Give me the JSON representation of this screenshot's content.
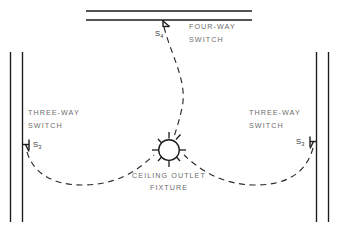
{
  "diagram": {
    "canvas": {
      "width": 339,
      "height": 234,
      "background": "#ffffff"
    },
    "colors": {
      "line": "#1a1a1a",
      "wire": "#2b2b2b",
      "label": "#6c6c6c",
      "symbol_label": "#3a3a3a",
      "background": "#ffffff"
    },
    "labels": {
      "four_way_line1": "FOUR-WAY",
      "four_way_line2": "SWITCH",
      "three_way_left_line1": "THREE-WAY",
      "three_way_left_line2": "SWITCH",
      "three_way_right_line1": "THREE-WAY",
      "three_way_right_line2": "SWITCH",
      "fixture_line1": "CEILING OUTLET",
      "fixture_line2": "FIXTURE"
    },
    "symbols": {
      "four_way_switch": {
        "letter": "S",
        "subscript": "4",
        "name": "four-way-switch-symbol"
      },
      "three_way_switch_left": {
        "letter": "S",
        "subscript": "3",
        "name": "three-way-switch-symbol-left"
      },
      "three_way_switch_right": {
        "letter": "S",
        "subscript": "3",
        "name": "three-way-switch-symbol-right"
      },
      "ceiling_fixture": {
        "name": "ceiling-outlet-fixture-symbol",
        "rays": 8
      }
    },
    "walls": {
      "top": {
        "x1": 86,
        "x2": 252,
        "y_outer": 11,
        "y_inner": 20
      },
      "left": {
        "y1": 52,
        "y2": 222,
        "x_outer": 10,
        "x_inner": 22
      },
      "right": {
        "y1": 52,
        "y2": 222,
        "x_inner": 316,
        "x_outer": 328
      }
    }
  }
}
